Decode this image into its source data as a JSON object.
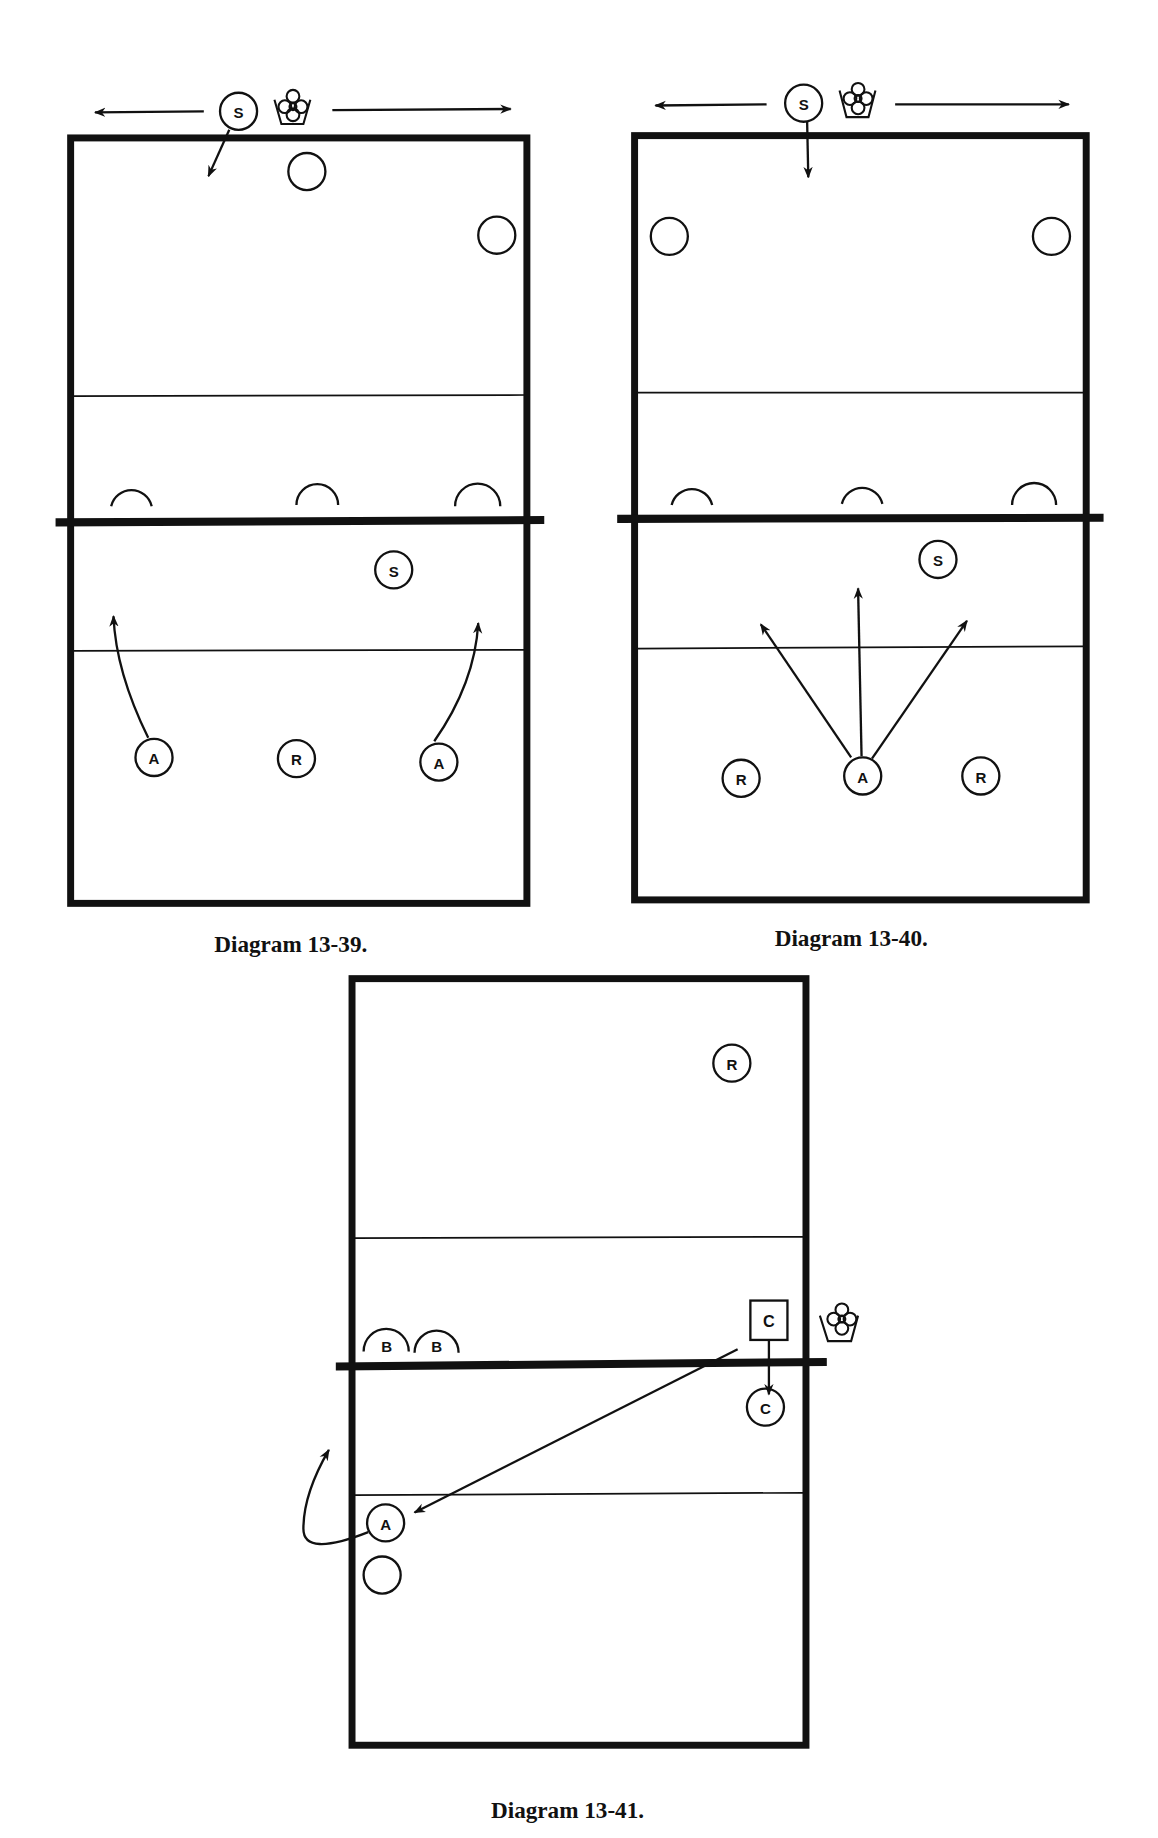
{
  "diagrams": [
    {
      "id": "13-39",
      "caption": "Diagram 13-39.",
      "players": [
        {
          "label": "S",
          "role": "server"
        },
        {
          "label": "S",
          "role": "setter"
        },
        {
          "label": "A",
          "role": "attacker-left"
        },
        {
          "label": "R",
          "role": "receiver"
        },
        {
          "label": "A",
          "role": "attacker-right"
        }
      ]
    },
    {
      "id": "13-40",
      "caption": "Diagram 13-40.",
      "players": [
        {
          "label": "S",
          "role": "server"
        },
        {
          "label": "S",
          "role": "setter"
        },
        {
          "label": "R",
          "role": "receiver-left"
        },
        {
          "label": "A",
          "role": "attacker"
        },
        {
          "label": "R",
          "role": "receiver-right"
        }
      ]
    },
    {
      "id": "13-41",
      "caption": "Diagram 13-41.",
      "players": [
        {
          "label": "R",
          "role": "receiver"
        },
        {
          "label": "C",
          "role": "coach"
        },
        {
          "label": "C",
          "role": "coach-position"
        },
        {
          "label": "A",
          "role": "attacker"
        },
        {
          "label": "B",
          "role": "blocker-1"
        },
        {
          "label": "B",
          "role": "blocker-2"
        }
      ]
    }
  ],
  "colors": {
    "ink": "#111111",
    "background": "#ffffff"
  }
}
